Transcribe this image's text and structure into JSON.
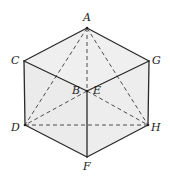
{
  "figure": {
    "colors": {
      "background": "#ffffff",
      "face": "#ededed",
      "edge": "#2a2a2a",
      "dashed": "#3a3a3a"
    },
    "vertices": {
      "A": {
        "x": 87,
        "y": 28
      },
      "C": {
        "x": 24,
        "y": 61
      },
      "G": {
        "x": 149,
        "y": 61
      },
      "B": {
        "x": 87,
        "y": 91
      },
      "D": {
        "x": 25,
        "y": 125
      },
      "H": {
        "x": 148,
        "y": 125
      },
      "F": {
        "x": 87,
        "y": 157
      }
    },
    "labels": [
      {
        "id": "A",
        "text": "A",
        "x": 83,
        "y": 21
      },
      {
        "id": "C",
        "text": "C",
        "x": 11,
        "y": 64
      },
      {
        "id": "G",
        "text": "G",
        "x": 152,
        "y": 64
      },
      {
        "id": "B",
        "text": "B",
        "x": 72,
        "y": 94
      },
      {
        "id": "E",
        "text": "E",
        "x": 93,
        "y": 94
      },
      {
        "id": "D",
        "text": "D",
        "x": 11,
        "y": 131
      },
      {
        "id": "H",
        "text": "H",
        "x": 151,
        "y": 131
      },
      {
        "id": "F",
        "text": "F",
        "x": 83,
        "y": 170
      }
    ],
    "solid_edges": [
      [
        "A",
        "C"
      ],
      [
        "A",
        "G"
      ],
      [
        "C",
        "B"
      ],
      [
        "B",
        "G"
      ],
      [
        "C",
        "D"
      ],
      [
        "G",
        "H"
      ],
      [
        "B",
        "F"
      ],
      [
        "D",
        "F"
      ],
      [
        "F",
        "H"
      ]
    ],
    "dashed_edges": [
      [
        "A",
        "B"
      ],
      [
        "A",
        "D"
      ],
      [
        "A",
        "H"
      ],
      [
        "B",
        "D"
      ],
      [
        "B",
        "H"
      ],
      [
        "D",
        "H"
      ]
    ]
  }
}
